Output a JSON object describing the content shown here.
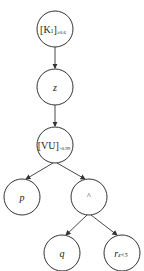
{
  "diagram": {
    "type": "tree",
    "nodes": [
      {
        "id": "k1",
        "label": "[K",
        "sub1": "1",
        "close": "]",
        "sub2": "≥0.6",
        "cx": 55,
        "cy": 29,
        "r": 18
      },
      {
        "id": "z",
        "label": "z",
        "cx": 55,
        "cy": 87,
        "r": 18
      },
      {
        "id": "vu",
        "label": "[VU]",
        "sub2": ">0.99",
        "cx": 55,
        "cy": 145,
        "r": 18
      },
      {
        "id": "p",
        "label": "p",
        "cx": 22,
        "cy": 197,
        "r": 18
      },
      {
        "id": "and",
        "label": "^",
        "cx": 89,
        "cy": 197,
        "r": 18
      },
      {
        "id": "q",
        "label": "q",
        "cx": 62,
        "cy": 253,
        "r": 18
      },
      {
        "id": "r",
        "label": "r",
        "sub2": "z<5",
        "cx": 122,
        "cy": 253,
        "r": 18
      }
    ],
    "edges": [
      {
        "from": "k1",
        "to": "z"
      },
      {
        "from": "z",
        "to": "vu"
      },
      {
        "from": "vu",
        "to": "p"
      },
      {
        "from": "vu",
        "to": "and"
      },
      {
        "from": "and",
        "to": "q"
      },
      {
        "from": "and",
        "to": "r"
      }
    ]
  }
}
